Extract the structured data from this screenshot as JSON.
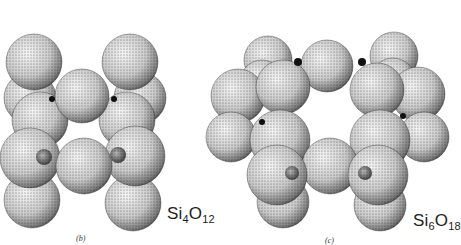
{
  "figure": {
    "panels": [
      {
        "id": "b",
        "label": "(b)",
        "formula": {
          "el1": "Si",
          "n1": "4",
          "el2": "O",
          "n2": "12"
        },
        "oxygen_spheres": [
          [
            30,
            98,
            26
          ],
          [
            140,
            98,
            26
          ],
          [
            34,
            62,
            28
          ],
          [
            130,
            62,
            28
          ],
          [
            40,
            120,
            28
          ],
          [
            127,
            120,
            28
          ],
          [
            82,
            96,
            27
          ],
          [
            32,
            200,
            28
          ],
          [
            133,
            203,
            28
          ],
          [
            30,
            158,
            30
          ],
          [
            135,
            156,
            30
          ],
          [
            84,
            166,
            28
          ]
        ],
        "silicon_dots": [
          [
            44,
            157,
            8
          ],
          [
            118,
            155,
            8
          ]
        ],
        "dark_dots": [
          [
            52,
            99,
            3
          ],
          [
            114,
            99,
            3
          ]
        ]
      },
      {
        "id": "c",
        "label": "(c)",
        "formula": {
          "el1": "Si",
          "n1": "6",
          "el2": "O",
          "n2": "18"
        },
        "oxygen_spheres": [
          [
            268,
            60,
            24
          ],
          [
            394,
            56,
            24
          ],
          [
            262,
            82,
            22
          ],
          [
            393,
            80,
            22
          ],
          [
            327,
            66,
            26
          ],
          [
            238,
            96,
            27
          ],
          [
            418,
            94,
            27
          ],
          [
            283,
            87,
            27
          ],
          [
            377,
            90,
            27
          ],
          [
            231,
            137,
            25
          ],
          [
            424,
            137,
            25
          ],
          [
            280,
            140,
            30
          ],
          [
            380,
            140,
            30
          ],
          [
            330,
            166,
            28
          ],
          [
            283,
            202,
            26
          ],
          [
            380,
            205,
            26
          ],
          [
            277,
            175,
            30
          ],
          [
            378,
            175,
            30
          ]
        ],
        "silicon_dots": [
          [
            292,
            173,
            7
          ],
          [
            365,
            173,
            7
          ]
        ],
        "dark_dots": [
          [
            298,
            62,
            4
          ],
          [
            362,
            62,
            4
          ],
          [
            262,
            122,
            3
          ],
          [
            403,
            116,
            3
          ]
        ]
      }
    ]
  }
}
